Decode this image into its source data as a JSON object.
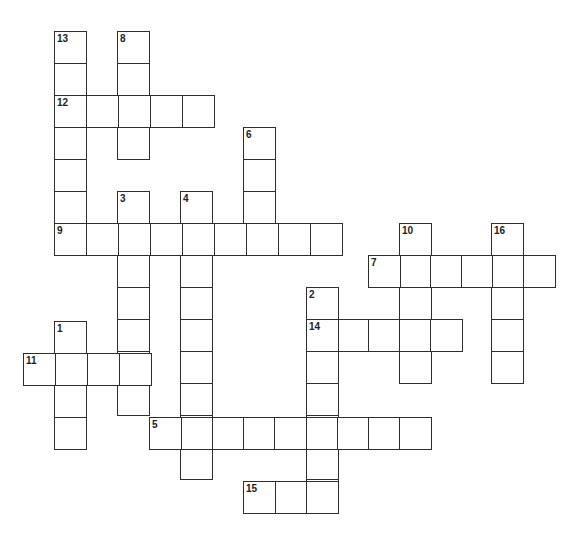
{
  "puzzle": {
    "type": "crossword",
    "cell_size": 32,
    "border_color": "#2e2e2e",
    "entries": [
      {
        "number": "13",
        "direction": "down",
        "x": 54,
        "y": 31,
        "length": 7
      },
      {
        "number": "8",
        "direction": "down",
        "x": 117,
        "y": 31,
        "length": 4
      },
      {
        "number": "12",
        "direction": "across",
        "x": 54,
        "y": 95,
        "length": 5
      },
      {
        "number": "6",
        "direction": "down",
        "x": 243,
        "y": 127,
        "length": 4
      },
      {
        "number": "3",
        "direction": "down",
        "x": 117,
        "y": 191,
        "length": 7
      },
      {
        "number": "4",
        "direction": "down",
        "x": 180,
        "y": 191,
        "length": 9
      },
      {
        "number": "9",
        "direction": "across",
        "x": 54,
        "y": 223,
        "length": 9
      },
      {
        "number": "10",
        "direction": "down",
        "x": 399,
        "y": 223,
        "length": 5
      },
      {
        "number": "16",
        "direction": "down",
        "x": 491,
        "y": 223,
        "length": 5
      },
      {
        "number": "7",
        "direction": "across",
        "x": 368,
        "y": 255,
        "length": 6,
        "pitch": 31
      },
      {
        "number": "2",
        "direction": "down",
        "x": 306,
        "y": 287,
        "length": 7
      },
      {
        "number": "14",
        "direction": "across",
        "x": 306,
        "y": 319,
        "length": 5,
        "pitch": 31
      },
      {
        "number": "1",
        "direction": "down",
        "x": 54,
        "y": 321,
        "length": 4
      },
      {
        "number": "11",
        "direction": "across",
        "x": 23,
        "y": 353,
        "length": 4
      },
      {
        "number": "5",
        "direction": "across",
        "x": 149,
        "y": 417,
        "length": 9,
        "pitch": 31.3
      },
      {
        "number": "15",
        "direction": "across",
        "x": 243,
        "y": 481,
        "length": 3,
        "pitch": 31.5
      }
    ]
  }
}
